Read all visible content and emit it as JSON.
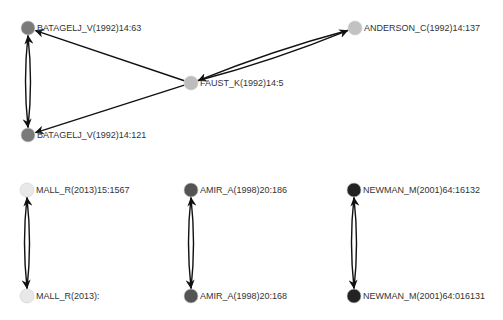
{
  "graph": {
    "type": "directed-citation-network",
    "nodes": [
      {
        "id": "n1",
        "label": "BATAGELJ_V(1992)14:63",
        "x": 28,
        "y": 28,
        "color": "#7a7a7a"
      },
      {
        "id": "n2",
        "label": "BATAGELJ_V(1992)14:121",
        "x": 28,
        "y": 135,
        "color": "#7a7a7a"
      },
      {
        "id": "n3",
        "label": "FAUST_K(1992)14:5",
        "x": 191,
        "y": 83,
        "color": "#bdbdbd"
      },
      {
        "id": "n4",
        "label": "ANDERSON_C(1992)14:137",
        "x": 355,
        "y": 28,
        "color": "#c2c2c2"
      },
      {
        "id": "n5",
        "label": "MALL_R(2013)15:1567",
        "x": 27,
        "y": 190,
        "color": "#e8e8e8"
      },
      {
        "id": "n6",
        "label": "MALL_R(2013):",
        "x": 27,
        "y": 296,
        "color": "#e8e8e8"
      },
      {
        "id": "n7",
        "label": "AMIR_A(1998)20:186",
        "x": 191,
        "y": 190,
        "color": "#545454"
      },
      {
        "id": "n8",
        "label": "AMIR_A(1998)20:168",
        "x": 191,
        "y": 296,
        "color": "#545454"
      },
      {
        "id": "n9",
        "label": "NEWMAN_M(2001)64:16132",
        "x": 354,
        "y": 190,
        "color": "#232323"
      },
      {
        "id": "n10",
        "label": "NEWMAN_M(2001)64:016131",
        "x": 354,
        "y": 296,
        "color": "#232323"
      }
    ],
    "edges": [
      {
        "from": "n3",
        "to": "n1"
      },
      {
        "from": "n3",
        "to": "n2"
      },
      {
        "from": "n1",
        "to": "n2"
      },
      {
        "from": "n2",
        "to": "n1"
      },
      {
        "from": "n3",
        "to": "n4"
      },
      {
        "from": "n4",
        "to": "n3"
      },
      {
        "from": "n5",
        "to": "n6"
      },
      {
        "from": "n6",
        "to": "n5"
      },
      {
        "from": "n7",
        "to": "n8"
      },
      {
        "from": "n8",
        "to": "n7"
      },
      {
        "from": "n9",
        "to": "n10"
      },
      {
        "from": "n10",
        "to": "n9"
      }
    ]
  }
}
